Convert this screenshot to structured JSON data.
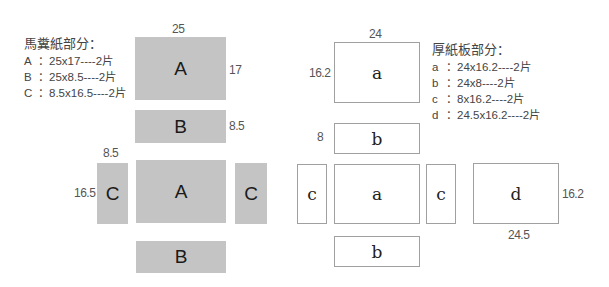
{
  "left_panel": {
    "legend": {
      "title": "馬糞紙部分：",
      "rows": [
        {
          "key": "A",
          "text": "：25x17----2片"
        },
        {
          "key": "B",
          "text": "：25x8.5----2片"
        },
        {
          "key": "C",
          "text": "：8.5x16.5----2片"
        }
      ]
    },
    "color": "#c4c4c4",
    "pieces": {
      "top_a": {
        "label": "A",
        "width_dim": "25",
        "height_dim": "17"
      },
      "top_b": {
        "label": "B",
        "height_dim": "8.5"
      },
      "left_c": {
        "label": "C",
        "width_dim": "8.5",
        "height_dim": "16.5"
      },
      "mid_a": {
        "label": "A"
      },
      "right_c": {
        "label": "C"
      },
      "bottom_b": {
        "label": "B"
      }
    }
  },
  "right_panel": {
    "legend": {
      "title": "厚紙板部分：",
      "rows": [
        {
          "key": "a",
          "text": "：24x16.2----2片"
        },
        {
          "key": "b",
          "text": "：24x8----2片"
        },
        {
          "key": "c",
          "text": "：8x16.2----2片"
        },
        {
          "key": "d",
          "text": "：24.5x16.2----2片"
        }
      ]
    },
    "outline_color": "#a0a0a0",
    "pieces": {
      "top_a": {
        "label": "a",
        "width_dim": "24",
        "height_dim": "16.2"
      },
      "top_b": {
        "label": "b",
        "height_dim": "8"
      },
      "left_c": {
        "label": "c"
      },
      "mid_a": {
        "label": "a"
      },
      "right_c": {
        "label": "c"
      },
      "bottom_b": {
        "label": "b"
      },
      "d": {
        "label": "d",
        "width_dim": "24.5",
        "height_dim": "16.2"
      }
    }
  }
}
